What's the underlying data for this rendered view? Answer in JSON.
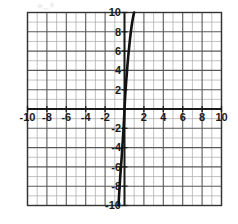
{
  "figure": {
    "name": "coordinate-grid-graph",
    "background": "#ffffff",
    "artifact_note": ""
  },
  "chart_data": {
    "type": "line",
    "title": "",
    "subtitle": "",
    "xlabel": "",
    "ylabel": "",
    "xlim": [
      -10,
      10
    ],
    "ylim": [
      -10,
      10
    ],
    "grid": true,
    "grid_major_step": 2,
    "grid_minor_step": 1,
    "legend": "none",
    "axis_color": "#1a1a1a",
    "grid_major_color": "#595959",
    "grid_minor_color": "#a8a8a8",
    "curve_color": "#111111",
    "curve_width": 2.6,
    "x_tick_labels": [
      "-10",
      "-8",
      "-6",
      "-4",
      "-2",
      "2",
      "4",
      "6",
      "8",
      "10"
    ],
    "x_tick_values": [
      -10,
      -8,
      -6,
      -4,
      -2,
      2,
      4,
      6,
      8,
      10
    ],
    "y_tick_labels": [
      "10",
      "8",
      "6",
      "4",
      "2",
      "-2",
      "-4",
      "-6",
      "-8",
      "-10"
    ],
    "y_tick_values": [
      10,
      8,
      6,
      4,
      2,
      -2,
      -4,
      -6,
      -8,
      -10
    ],
    "series": [
      {
        "name": "steep-cubic-curve",
        "description": "odd steeply-increasing curve through the origin",
        "x": [
          -0.62,
          -0.58,
          -0.54,
          -0.49,
          -0.44,
          -0.38,
          -0.32,
          -0.26,
          -0.2,
          -0.14,
          -0.08,
          -0.03,
          0.0,
          0.04,
          0.1,
          0.17,
          0.24,
          0.31,
          0.39,
          0.47,
          0.55,
          0.63,
          0.72,
          0.81,
          0.9,
          0.99
        ],
        "y": [
          -10.0,
          -9.3,
          -8.6,
          -7.8,
          -7.0,
          -6.2,
          -5.4,
          -4.5,
          -3.6,
          -2.7,
          -1.7,
          -0.7,
          0.0,
          0.8,
          1.8,
          2.8,
          3.7,
          4.6,
          5.5,
          6.3,
          7.1,
          7.8,
          8.5,
          9.1,
          9.6,
          10.0
        ]
      }
    ]
  }
}
